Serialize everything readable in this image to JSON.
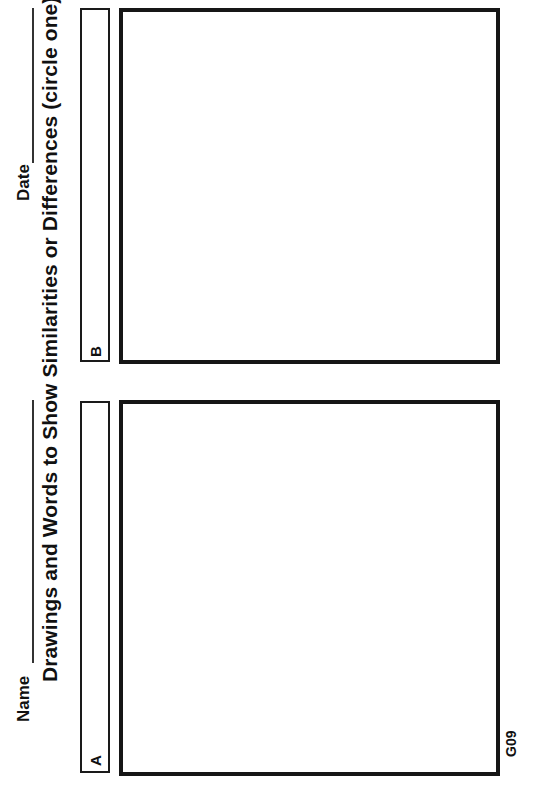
{
  "worksheet": {
    "title": "Drawings and Words to Show Similarities or Differences (circle one)",
    "name_label": "Name",
    "date_label": "Date",
    "panels": [
      {
        "label": "A"
      },
      {
        "label": "B"
      }
    ],
    "page_code": "G09"
  }
}
